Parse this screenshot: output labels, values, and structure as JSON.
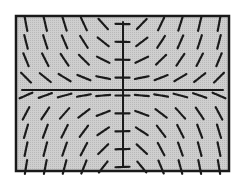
{
  "chart_data": {
    "type": "slope_field",
    "title": "",
    "xlabel": "",
    "ylabel": "",
    "equation_shape": "dy/dx proportional to x*y",
    "grid": false,
    "legend": null,
    "frame": {
      "x": 16,
      "y": 16,
      "width": 213,
      "height": 155
    },
    "axes": {
      "x_axis_y": 90,
      "y_axis_x": 123
    },
    "grid_columns": 10,
    "grid_rows": 8,
    "slope_scale": 0.18,
    "segment_length": 14,
    "colors": {
      "background": "#ffffff",
      "plot_fill": "#c8c8c8",
      "frame": "#1a1a1a",
      "segments": "#1a1a1a",
      "axes": "#1a1a1a"
    }
  }
}
